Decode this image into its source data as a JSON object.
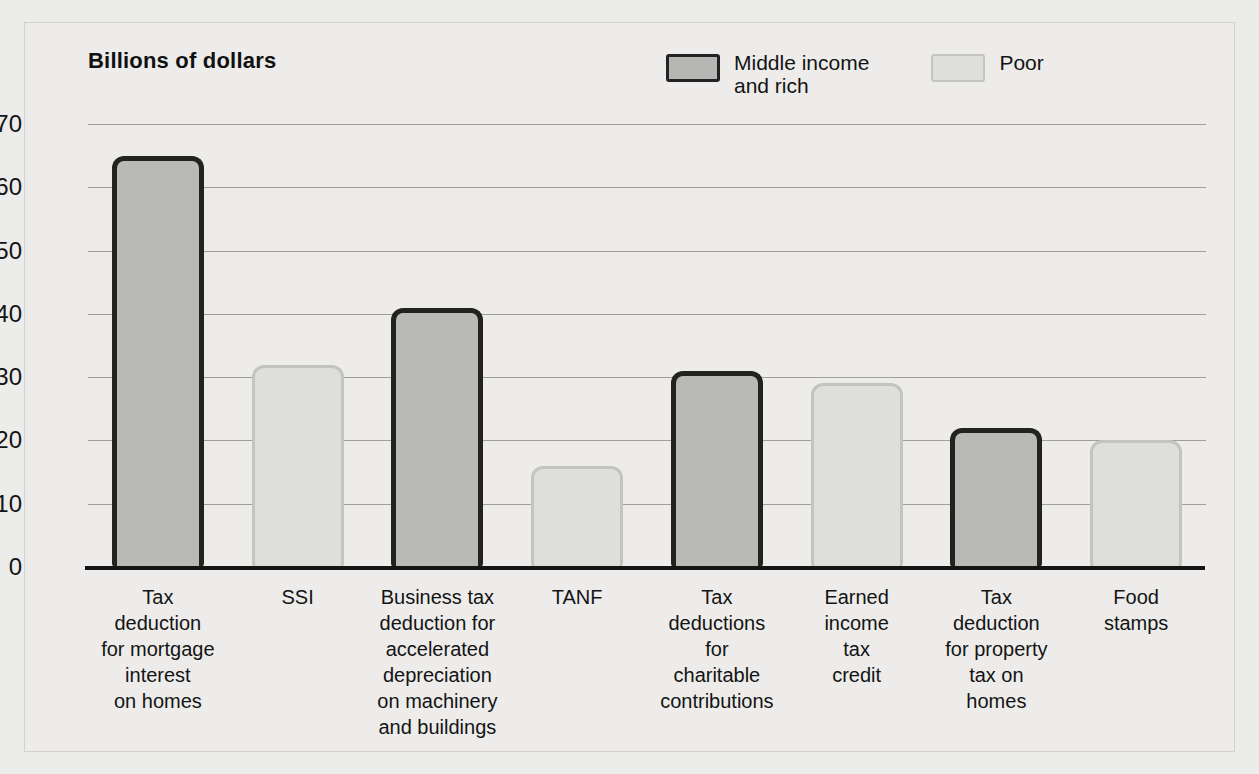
{
  "chart_data": {
    "type": "bar",
    "title": "Billions of dollars",
    "xlabel": "",
    "ylabel": "Billions of dollars",
    "ylim": [
      0,
      70
    ],
    "yticks": [
      0,
      10,
      20,
      30,
      40,
      50,
      60,
      70
    ],
    "grid": true,
    "legend_position": "top-right",
    "categories": [
      "Tax\ndeduction\nfor mortgage\ninterest\non homes",
      "SSI",
      "Business tax\ndeduction for\naccelerated\ndepreciation\non machinery\nand buildings",
      "TANF",
      "Tax\ndeductions\nfor\ncharitable\ncontributions",
      "Earned\nincome\ntax\ncredit",
      "Tax\ndeduction\nfor property\ntax on\nhomes",
      "Food\nstamps"
    ],
    "values": [
      65,
      32,
      41,
      16,
      31,
      29,
      22,
      20
    ],
    "groups": [
      "Middle income and rich",
      "Poor",
      "Middle income and rich",
      "Poor",
      "Middle income and rich",
      "Poor",
      "Middle income and rich",
      "Poor"
    ],
    "series": [
      {
        "name": "Middle income and rich",
        "color": "#b9b9b6",
        "border_color": "#222221",
        "points": [
          {
            "category": "Tax deduction for mortgage interest on homes",
            "value": 65
          },
          {
            "category": "Business tax deduction for accelerated depreciation on machinery and buildings",
            "value": 41
          },
          {
            "category": "Tax deductions for charitable contributions",
            "value": 31
          },
          {
            "category": "Tax deduction for property tax on homes",
            "value": 22
          }
        ]
      },
      {
        "name": "Poor",
        "color": "#dededb",
        "border_color": "#c3c3c0",
        "points": [
          {
            "category": "SSI",
            "value": 32
          },
          {
            "category": "TANF",
            "value": 16
          },
          {
            "category": "Earned income tax credit",
            "value": 29
          },
          {
            "category": "Food stamps",
            "value": 20
          }
        ]
      }
    ]
  },
  "legend": {
    "items": [
      {
        "label": "Middle income\nand rich",
        "style": "dark"
      },
      {
        "label": "Poor",
        "style": "light"
      }
    ]
  },
  "colors": {
    "background": "#ececeb",
    "dark_fill": "#b9b9b6",
    "dark_border": "#222221",
    "light_fill": "#dededb",
    "light_border": "#c3c3c0",
    "gridline": "#9e9e9c",
    "axis": "#151515",
    "text": "#141414"
  }
}
